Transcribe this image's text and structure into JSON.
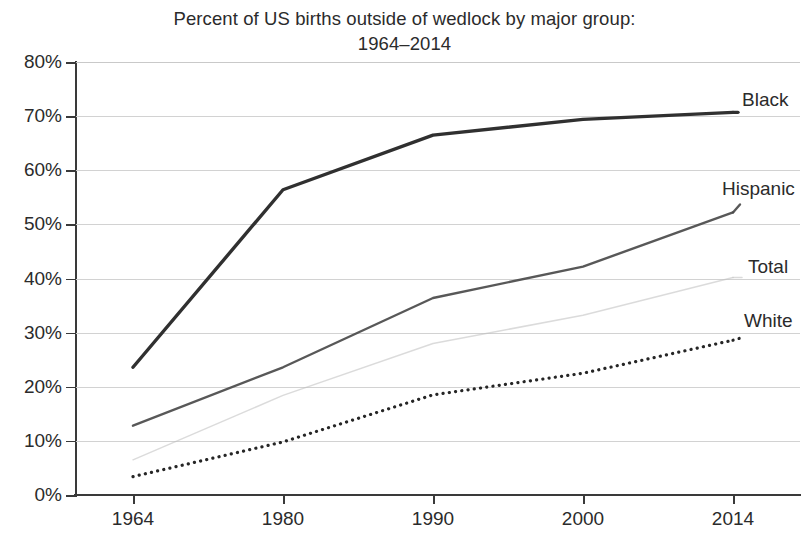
{
  "chart": {
    "title_line_1": "Percent of US births outside of wedlock by major group:",
    "title_line_2": "1964–2014"
  },
  "axes": {
    "y_labels": [
      "80%",
      "70%",
      "60%",
      "50%",
      "40%",
      "30%",
      "20%",
      "10%",
      "0%"
    ],
    "x_labels": [
      "1964",
      "1980",
      "1990",
      "2000",
      "2014"
    ]
  },
  "series_labels": {
    "black": "Black",
    "hispanic": "Hispanic",
    "total": "Total",
    "white": "White"
  },
  "chart_data": {
    "type": "line",
    "title": "Percent of US births outside of wedlock by major group: 1964–2014",
    "xlabel": "",
    "ylabel": "",
    "categories": [
      "1964",
      "1980",
      "1990",
      "2000",
      "2014"
    ],
    "ylim": [
      0,
      80
    ],
    "ytick_values": [
      0,
      10,
      20,
      30,
      40,
      50,
      60,
      70,
      80
    ],
    "ytick_labels": [
      "0%",
      "10%",
      "20%",
      "30%",
      "40%",
      "50%",
      "60%",
      "70%",
      "80%"
    ],
    "grid": true,
    "legend_position": "right-inline-labels",
    "value_unit": "percent",
    "series": [
      {
        "name": "Black",
        "values": [
          23.6,
          56.4,
          66.5,
          69.4,
          70.7
        ],
        "style": "solid-thick",
        "color": "#303030"
      },
      {
        "name": "Hispanic",
        "values": [
          12.8,
          23.6,
          36.4,
          42.2,
          52.2
        ],
        "style": "solid-medium",
        "color": "#4a4a4a"
      },
      {
        "name": "Total",
        "values": [
          6.5,
          18.4,
          28.0,
          33.2,
          40.2
        ],
        "style": "solid-thin-light",
        "color": "#bdbdbd"
      },
      {
        "name": "White",
        "values": [
          3.4,
          9.8,
          18.5,
          22.5,
          28.6
        ],
        "style": "dotted",
        "color": "#262626"
      }
    ]
  }
}
